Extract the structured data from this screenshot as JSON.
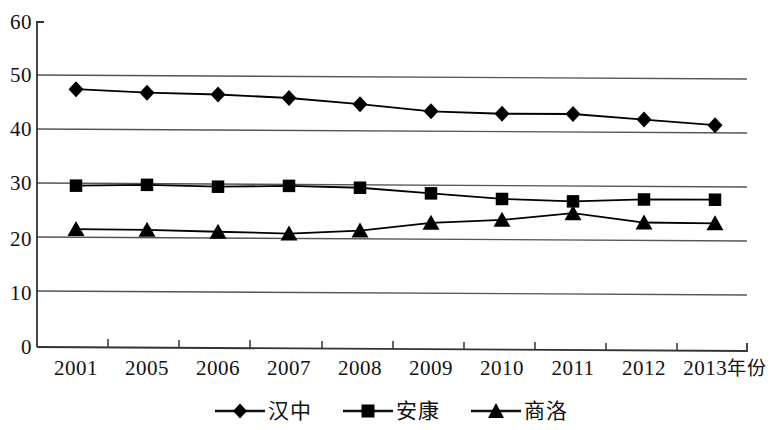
{
  "chart_data": {
    "type": "line",
    "title": "",
    "xlabel": "年份",
    "ylabel": "",
    "categories": [
      "2001",
      "2005",
      "2006",
      "2007",
      "2008",
      "2009",
      "2010",
      "2011",
      "2012",
      "2013"
    ],
    "x_axis_unit_label": "年份",
    "ylim": [
      0,
      60
    ],
    "yticks": [
      0,
      10,
      20,
      30,
      40,
      50,
      60
    ],
    "grid": "horizontal",
    "legend_position": "bottom-center",
    "series": [
      {
        "name": "汉中",
        "marker": "diamond",
        "color": "#000000",
        "values": [
          48.1,
          47.6,
          47.4,
          46.9,
          45.9,
          44.7,
          44.4,
          44.5,
          43.6,
          42.7
        ]
      },
      {
        "name": "安康",
        "marker": "square",
        "color": "#000000",
        "values": [
          30.1,
          30.4,
          30.2,
          30.5,
          30.3,
          29.4,
          28.5,
          28.2,
          28.7,
          28.8
        ]
      },
      {
        "name": "商洛",
        "marker": "triangle",
        "color": "#000000",
        "values": [
          22.0,
          22.0,
          21.8,
          21.6,
          22.3,
          23.9,
          24.6,
          26.0,
          24.4,
          24.4
        ]
      }
    ]
  },
  "axis": {
    "y_tick_labels": [
      "60",
      "50",
      "40",
      "30",
      "20",
      "10",
      "0"
    ],
    "x_tick_labels": [
      "2001",
      "2005",
      "2006",
      "2007",
      "2008",
      "2009",
      "2010",
      "2011",
      "2012",
      "2013"
    ],
    "x_unit_suffix": "年份"
  },
  "legend": {
    "items": [
      {
        "label": "汉中",
        "marker": "diamond"
      },
      {
        "label": "安康",
        "marker": "square"
      },
      {
        "label": "商洛",
        "marker": "triangle"
      }
    ]
  },
  "style": {
    "line_color": "#1a1a1a",
    "grid_color": "#4d4d4d",
    "axis_color": "#333333",
    "background": "#ffffff"
  }
}
